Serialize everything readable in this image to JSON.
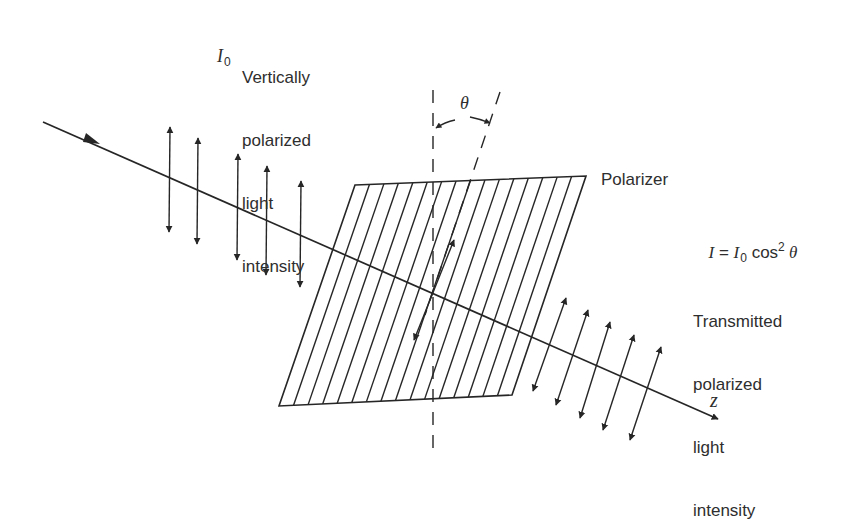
{
  "diagram": {
    "colors": {
      "stroke": "#262626",
      "text": "#2e2e2e",
      "background": "#ffffff"
    },
    "incident": {
      "symbol": "I",
      "subscript": "0",
      "description_lines": [
        "Vertically",
        "polarized",
        "light",
        "intensity"
      ]
    },
    "angle_label": "θ",
    "polarizer_label": "Polarizer",
    "law": {
      "lhs": "I",
      "equals": " = ",
      "symbol": "I",
      "subscript": "0",
      "func": " cos",
      "exponent": "2",
      "angle": " θ"
    },
    "transmitted": {
      "description_lines": [
        "Transmitted",
        "polarized",
        "light",
        "intensity"
      ]
    },
    "axis_label": "z",
    "geometry": {
      "z_axis": {
        "x1": 43,
        "y1": 122,
        "x2": 718,
        "y2": 419
      },
      "polarizer_corners": [
        [
          355,
          185
        ],
        [
          586,
          176
        ],
        [
          512,
          395
        ],
        [
          279,
          406
        ]
      ],
      "vertical_axis": {
        "x": 433,
        "y1": 90,
        "y2": 455
      },
      "tilted_axis": {
        "x1": 500,
        "y1": 92,
        "x2": 425,
        "y2": 315
      },
      "incident_arrows": [
        {
          "x": 169,
          "top": 127,
          "bottom": 232
        },
        {
          "x": 197,
          "top": 138,
          "bottom": 244
        },
        {
          "x": 237,
          "top": 154,
          "bottom": 260
        },
        {
          "x": 266,
          "top": 166,
          "bottom": 275
        },
        {
          "x": 300,
          "top": 181,
          "bottom": 287
        }
      ],
      "center_arrow": {
        "x1": 414,
        "y1": 340,
        "x2": 454,
        "y2": 240
      },
      "transmitted_arrows": [
        {
          "x1": 533,
          "y1": 391,
          "x2": 566,
          "y2": 298
        },
        {
          "x1": 556,
          "y1": 405,
          "x2": 588,
          "y2": 310
        },
        {
          "x1": 580,
          "y1": 418,
          "x2": 610,
          "y2": 322
        },
        {
          "x1": 603,
          "y1": 430,
          "x2": 634,
          "y2": 335
        },
        {
          "x1": 630,
          "y1": 440,
          "x2": 661,
          "y2": 347
        }
      ]
    }
  }
}
